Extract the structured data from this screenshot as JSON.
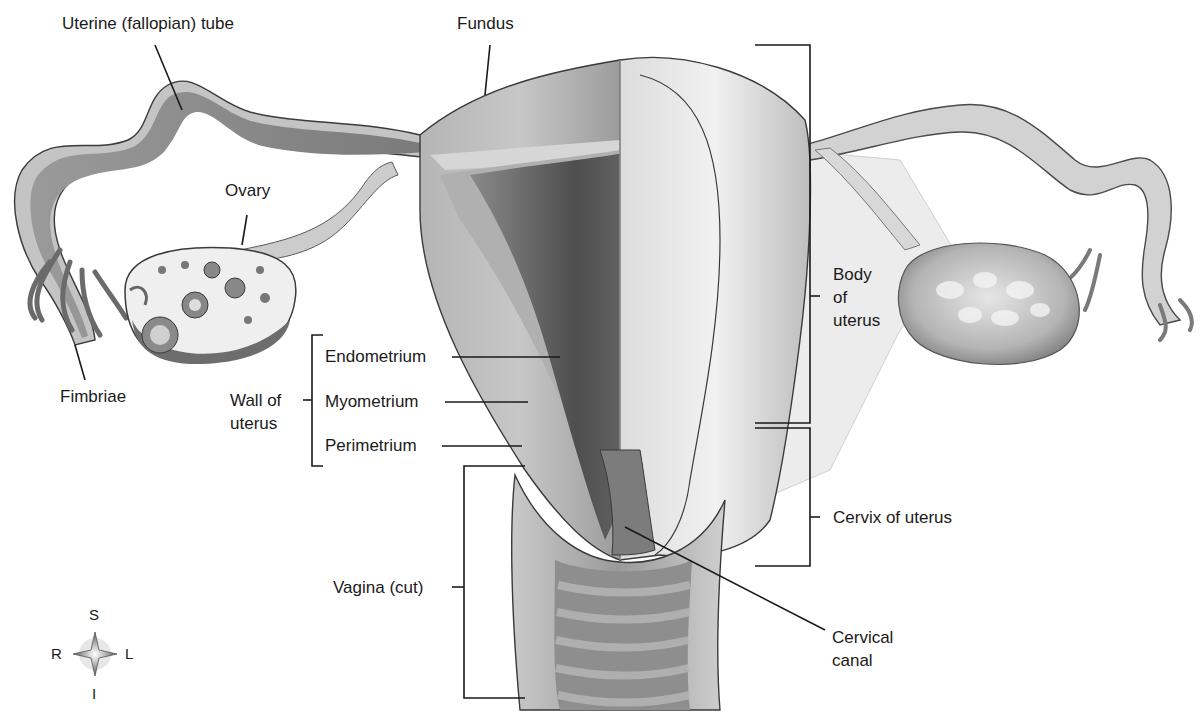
{
  "figure": {
    "colors": {
      "background": "#ffffff",
      "tissue_light": "#d9d9d9",
      "tissue_mid": "#a8a8a8",
      "tissue_dark": "#5e5e5e",
      "leader_line": "#1a1a1a"
    }
  },
  "labels": {
    "uterine_tube": "Uterine (fallopian) tube",
    "fundus": "Fundus",
    "ovary": "Ovary",
    "fimbriae": "Fimbriae",
    "wall_of_uterus_line1": "Wall of",
    "wall_of_uterus_line2": "uterus",
    "endometrium": "Endometrium",
    "myometrium": "Myometrium",
    "perimetrium": "Perimetrium",
    "body_line1": "Body",
    "body_line2": "of",
    "body_line3": "uterus",
    "cervix": "Cervix of uterus",
    "vagina": "Vagina (cut)",
    "cervical_canal_line1": "Cervical",
    "cervical_canal_line2": "canal"
  },
  "compass": {
    "superior": "S",
    "inferior": "I",
    "right": "R",
    "left": "L"
  }
}
